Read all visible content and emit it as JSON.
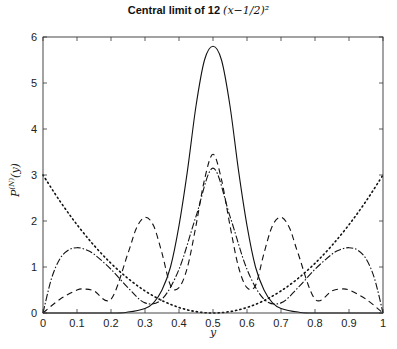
{
  "chart_data": {
    "type": "line",
    "title_text": "Central limit of 12",
    "title_math": "(x−1/2)²",
    "xlabel": "y",
    "ylabel": "P^(N)(y)",
    "xlim": [
      0,
      1
    ],
    "ylim": [
      0,
      6
    ],
    "xticks": [
      "0",
      "0.1",
      "0.2",
      "0.3",
      "0.4",
      "0.5",
      "0.6",
      "0.7",
      "0.8",
      "0.9",
      "1"
    ],
    "yticks": [
      "0",
      "1",
      "2",
      "3",
      "4",
      "5",
      "6"
    ],
    "grid": false,
    "legend": null,
    "series": [
      {
        "name": "N=1",
        "style": "dotted",
        "x": [
          0,
          0.05,
          0.1,
          0.15,
          0.2,
          0.25,
          0.3,
          0.35,
          0.4,
          0.45,
          0.5,
          0.55,
          0.6,
          0.65,
          0.7,
          0.75,
          0.8,
          0.85,
          0.9,
          0.95,
          1
        ],
        "y": [
          3.0,
          2.43,
          1.92,
          1.47,
          1.08,
          0.75,
          0.48,
          0.27,
          0.12,
          0.03,
          0.0,
          0.03,
          0.12,
          0.27,
          0.48,
          0.75,
          1.08,
          1.47,
          1.92,
          2.43,
          3.0
        ]
      },
      {
        "name": "N=2",
        "style": "dash-dot",
        "x": [
          0,
          0.025,
          0.05,
          0.075,
          0.1,
          0.125,
          0.15,
          0.2,
          0.25,
          0.3,
          0.35,
          0.4,
          0.45,
          0.5,
          0.55,
          0.6,
          0.65,
          0.7,
          0.75,
          0.8,
          0.85,
          0.875,
          0.9,
          0.925,
          0.95,
          0.975,
          1
        ],
        "y": [
          0.0,
          0.75,
          1.18,
          1.37,
          1.42,
          1.38,
          1.28,
          0.95,
          0.55,
          0.22,
          0.3,
          0.95,
          2.1,
          3.15,
          2.1,
          0.95,
          0.3,
          0.22,
          0.55,
          0.95,
          1.28,
          1.38,
          1.42,
          1.37,
          1.18,
          0.75,
          0.0
        ]
      },
      {
        "name": "N=3",
        "style": "dashed",
        "x": [
          0,
          0.05,
          0.1,
          0.125,
          0.15,
          0.2,
          0.25,
          0.275,
          0.3,
          0.325,
          0.35,
          0.375,
          0.4,
          0.425,
          0.45,
          0.475,
          0.5,
          0.525,
          0.55,
          0.575,
          0.6,
          0.625,
          0.65,
          0.675,
          0.7,
          0.725,
          0.75,
          0.8,
          0.85,
          0.875,
          0.9,
          0.95,
          1
        ],
        "y": [
          0.0,
          0.3,
          0.5,
          0.52,
          0.48,
          0.3,
          1.3,
          1.85,
          2.08,
          1.9,
          1.3,
          0.6,
          0.55,
          1.0,
          1.9,
          2.9,
          3.45,
          2.9,
          1.9,
          1.0,
          0.55,
          0.6,
          1.3,
          1.9,
          2.08,
          1.85,
          1.3,
          0.3,
          0.48,
          0.52,
          0.5,
          0.3,
          0.0
        ]
      },
      {
        "name": "N=large",
        "style": "solid",
        "x": [
          0,
          0.2,
          0.25,
          0.3,
          0.325,
          0.35,
          0.375,
          0.4,
          0.425,
          0.45,
          0.475,
          0.5,
          0.525,
          0.55,
          0.575,
          0.6,
          0.625,
          0.65,
          0.675,
          0.7,
          0.75,
          0.8,
          1
        ],
        "y": [
          0.0,
          0.0,
          0.02,
          0.1,
          0.22,
          0.5,
          1.0,
          1.9,
          3.1,
          4.5,
          5.5,
          5.8,
          5.5,
          4.5,
          3.1,
          1.9,
          1.0,
          0.5,
          0.22,
          0.1,
          0.02,
          0.0,
          0.0
        ]
      }
    ]
  }
}
